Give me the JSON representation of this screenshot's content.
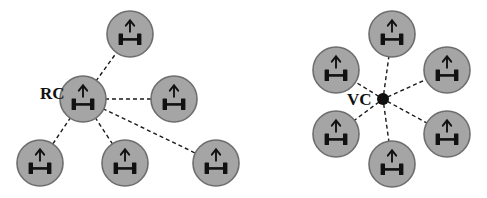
{
  "figure": {
    "background_color": "#ffffff",
    "width": 487,
    "height": 198
  },
  "style": {
    "robot_fill": "#a5a5a5",
    "robot_stroke": "#6e6e6e",
    "glyph_color": "#111111",
    "link_color": "#1a1a1a",
    "hub_color": "#111111",
    "label_color": "#111111",
    "robot_radius": 23,
    "link_dash": "4 3",
    "link_width": 1.4
  },
  "clusters": [
    {
      "id": "rc-cluster",
      "label": "RC",
      "label_name": "rc-label",
      "label_x": 40,
      "label_y": 95,
      "topology": "leader-follower",
      "hub": null,
      "leader": {
        "name": "rc-leader-robot",
        "x": 83,
        "y": 99,
        "icon": "robot-up-arrow-icon"
      },
      "followers": [
        {
          "name": "rc-follower-top",
          "x": 130,
          "y": 34,
          "icon": "robot-up-arrow-icon"
        },
        {
          "name": "rc-follower-right",
          "x": 174,
          "y": 99,
          "icon": "robot-up-arrow-icon"
        },
        {
          "name": "rc-follower-bottom-left",
          "x": 40,
          "y": 163,
          "icon": "robot-up-arrow-icon"
        },
        {
          "name": "rc-follower-bottom-center",
          "x": 125,
          "y": 163,
          "icon": "robot-up-arrow-icon"
        },
        {
          "name": "rc-follower-bottom-right",
          "x": 216,
          "y": 163,
          "icon": "robot-up-arrow-icon"
        }
      ],
      "links": [
        {
          "name": "rc-link-top",
          "from": "leader",
          "to": "rc-follower-top"
        },
        {
          "name": "rc-link-right",
          "from": "leader",
          "to": "rc-follower-right"
        },
        {
          "name": "rc-link-bottom-left",
          "from": "leader",
          "to": "rc-follower-bottom-left"
        },
        {
          "name": "rc-link-bottom-center",
          "from": "leader",
          "to": "rc-follower-bottom-center"
        },
        {
          "name": "rc-link-bottom-right",
          "from": "leader",
          "to": "rc-follower-bottom-right"
        }
      ]
    },
    {
      "id": "vc-cluster",
      "label": "VC",
      "label_name": "vc-label",
      "label_x": 347,
      "label_y": 101,
      "topology": "virtual-center",
      "hub": {
        "name": "vc-hub-dot",
        "x": 383,
        "y": 99,
        "radius": 6
      },
      "leader": null,
      "followers": [
        {
          "name": "vc-robot-top",
          "x": 392,
          "y": 34,
          "icon": "robot-up-arrow-icon"
        },
        {
          "name": "vc-robot-upper-left",
          "x": 336,
          "y": 70,
          "icon": "robot-up-arrow-icon"
        },
        {
          "name": "vc-robot-upper-right",
          "x": 447,
          "y": 70,
          "icon": "robot-up-arrow-icon"
        },
        {
          "name": "vc-robot-lower-left",
          "x": 336,
          "y": 134,
          "icon": "robot-up-arrow-icon"
        },
        {
          "name": "vc-robot-lower-right",
          "x": 447,
          "y": 134,
          "icon": "robot-up-arrow-icon"
        },
        {
          "name": "vc-robot-bottom",
          "x": 392,
          "y": 164,
          "icon": "robot-up-arrow-icon"
        }
      ],
      "links": [
        {
          "name": "vc-link-top",
          "from": "hub",
          "to": "vc-robot-top"
        },
        {
          "name": "vc-link-upper-left",
          "from": "hub",
          "to": "vc-robot-upper-left"
        },
        {
          "name": "vc-link-upper-right",
          "from": "hub",
          "to": "vc-robot-upper-right"
        },
        {
          "name": "vc-link-lower-left",
          "from": "hub",
          "to": "vc-robot-lower-left"
        },
        {
          "name": "vc-link-lower-right",
          "from": "hub",
          "to": "vc-robot-lower-right"
        },
        {
          "name": "vc-link-bottom",
          "from": "hub",
          "to": "vc-robot-bottom"
        }
      ]
    }
  ]
}
